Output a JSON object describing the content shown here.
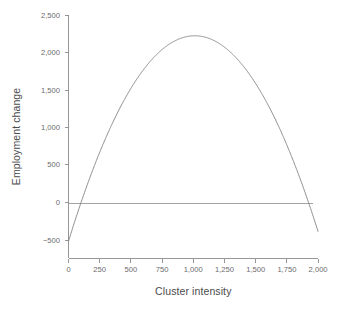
{
  "chart_data": {
    "type": "line",
    "title": "",
    "xlabel": "Cluster intensity",
    "ylabel": "Employment change",
    "xlim": [
      0,
      2000
    ],
    "ylim": [
      -500,
      2500
    ],
    "grid": false,
    "legend": false,
    "x_ticks": [
      0,
      250,
      500,
      750,
      1000,
      1250,
      1500,
      1750,
      2000
    ],
    "x_tick_labels": [
      "0",
      "250",
      "500",
      "750",
      "1,000",
      "1,250",
      "1,500",
      "1,750",
      "2,000"
    ],
    "y_ticks": [
      -500,
      0,
      500,
      1000,
      1500,
      2000,
      2500
    ],
    "y_tick_labels": [
      "−500",
      "0",
      "500",
      "1,000",
      "1,500",
      "2,000",
      "2,500"
    ],
    "series": [
      {
        "name": "Employment change",
        "kind": "quadratic-curve",
        "color": "#7b7b7d",
        "x": [
          0,
          100,
          200,
          300,
          400,
          500,
          600,
          700,
          800,
          900,
          1000,
          1100,
          1200,
          1300,
          1400,
          1500,
          1600,
          1700,
          1800,
          1900,
          2000
        ],
        "y": [
          -480,
          30,
          480,
          880,
          1220,
          1510,
          1750,
          1930,
          2070,
          2160,
          2200,
          2190,
          2130,
          2020,
          1850,
          1630,
          1360,
          1040,
          660,
          230,
          -650
        ]
      },
      {
        "name": "Zero reference line",
        "kind": "horizontal-reference",
        "color": "#9a9a9c",
        "x": [
          0,
          1960
        ],
        "y": [
          0,
          0
        ]
      }
    ],
    "annotations": []
  }
}
